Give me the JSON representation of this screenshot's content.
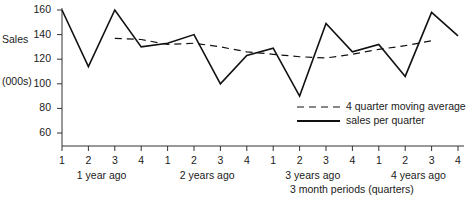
{
  "chart_data": {
    "type": "line",
    "title": "",
    "xlabel": "3 month periods (quarters)",
    "ylabel": "Sales (000s)",
    "ylabel_lines": [
      "Sales",
      "(000s)"
    ],
    "ylim": [
      50,
      160
    ],
    "yticks": [
      60,
      80,
      100,
      120,
      140,
      160
    ],
    "ytick_labels": [
      "60",
      "80",
      "100",
      "120",
      "140",
      "160"
    ],
    "grid": false,
    "legend_position": "inside lower right",
    "x": [
      1,
      2,
      3,
      4,
      5,
      6,
      7,
      8,
      9,
      10,
      11,
      12,
      13,
      14,
      15,
      16
    ],
    "xtick_labels": [
      "1",
      "2",
      "3",
      "4",
      "1",
      "2",
      "3",
      "4",
      "1",
      "2",
      "3",
      "4",
      "1",
      "2",
      "3",
      "4"
    ],
    "group_labels": [
      "1 year ago",
      "2 years ago",
      "3 years ago",
      "4 years ago"
    ],
    "series": [
      {
        "name": "sales per quarter",
        "style": "solid",
        "color": "#111111",
        "values": [
          160,
          114,
          160,
          130,
          133,
          140,
          100,
          123,
          129,
          90,
          149,
          126,
          132,
          106,
          158,
          139
        ]
      },
      {
        "name": "4 quarter moving average",
        "style": "dashed",
        "color": "#111111",
        "x": [
          3,
          4,
          5,
          6,
          7,
          8,
          9,
          10,
          11,
          12,
          13,
          14,
          15
        ],
        "values": [
          137,
          136,
          132,
          133,
          130,
          126,
          124,
          122,
          121,
          124,
          128,
          131,
          135
        ]
      }
    ]
  },
  "legend": {
    "items": [
      {
        "label": "4 quarter moving average",
        "style": "dashed"
      },
      {
        "label": "sales per quarter",
        "style": "solid"
      }
    ]
  }
}
